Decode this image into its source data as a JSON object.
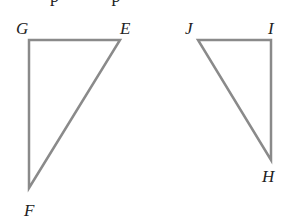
{
  "diagram": {
    "stroke_color": "#8a8a8a",
    "label_color": "#222222",
    "clipped_text_top": "p p",
    "triangles": [
      {
        "name": "GEF",
        "vertices": [
          {
            "label": "G",
            "x": 29,
            "y": 40
          },
          {
            "label": "E",
            "x": 120,
            "y": 40
          },
          {
            "label": "F",
            "x": 29,
            "y": 188
          }
        ],
        "right_angle_at": "G"
      },
      {
        "name": "JIH",
        "vertices": [
          {
            "label": "J",
            "x": 198,
            "y": 40
          },
          {
            "label": "I",
            "x": 271,
            "y": 40
          },
          {
            "label": "H",
            "x": 271,
            "y": 160
          }
        ],
        "right_angle_at": "I"
      }
    ]
  }
}
